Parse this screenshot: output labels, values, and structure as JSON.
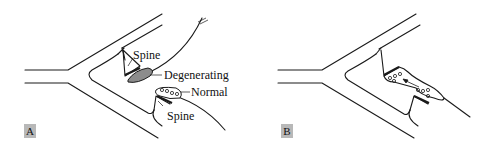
{
  "panels": [
    {
      "id": "A",
      "badge": "A",
      "labels": {
        "spine_top": "Spine",
        "degenerating": "Degenerating",
        "normal": "Normal",
        "spine_bottom": "Spine"
      }
    },
    {
      "id": "B",
      "badge": "B"
    }
  ],
  "colors": {
    "line": "#1a1a1a",
    "degenerating_fill": "#8c8c8c",
    "badge_bg": "#b8b8b8"
  }
}
